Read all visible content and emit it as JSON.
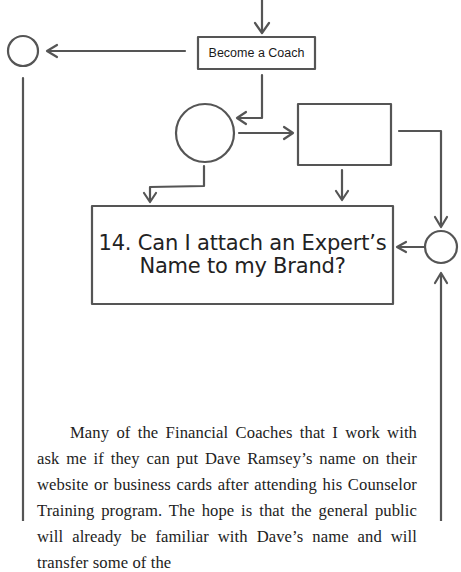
{
  "diagram": {
    "nodes": {
      "become_coach": {
        "label": "Become a Coach"
      },
      "main_question": {
        "number": "14.",
        "line1": "14. Can I attach an Expert’s",
        "line2": "Name to my Brand?"
      }
    }
  },
  "body": {
    "paragraph": "Many of the Financial Coaches that I work with ask me if they can put Dave Ramsey’s name on their website or business cards after attending his Counselor Training program. The hope is that the general public will already be familiar with Dave’s name and will transfer some of the"
  },
  "colors": {
    "stroke": "#555555",
    "text": "#222222",
    "background": "#ffffff"
  }
}
